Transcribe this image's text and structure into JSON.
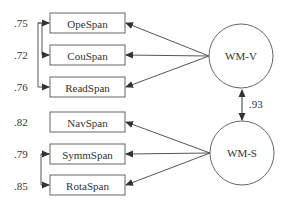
{
  "diagram": {
    "type": "structural-equation-model",
    "observed": [
      {
        "id": "OpeSpan",
        "label": "OpeSpan",
        "loading": ".75",
        "factor": "WM-V"
      },
      {
        "id": "CouSpan",
        "label": "CouSpan",
        "loading": ".72",
        "factor": "WM-V"
      },
      {
        "id": "ReadSpan",
        "label": "ReadSpan",
        "loading": ".76",
        "factor": "WM-V"
      },
      {
        "id": "NavSpan",
        "label": "NavSpan",
        "loading": ".82",
        "factor": "WM-S"
      },
      {
        "id": "SymmSpan",
        "label": "SymmSpan",
        "loading": ".79",
        "factor": "WM-S"
      },
      {
        "id": "RotaSpan",
        "label": "RotaSpan",
        "loading": ".85",
        "factor": "WM-S"
      }
    ],
    "latent": [
      {
        "id": "WM-V",
        "label": "WM-V"
      },
      {
        "id": "WM-S",
        "label": "WM-S"
      }
    ],
    "correlation": {
      "from": "WM-V",
      "to": "WM-S",
      "value": ".93"
    },
    "error_covariances": [
      {
        "from": "OpeSpan",
        "to": "CouSpan"
      },
      {
        "from": "OpeSpan",
        "to": "ReadSpan"
      },
      {
        "from": "SymmSpan",
        "to": "RotaSpan"
      }
    ],
    "colors": {
      "stroke": "#555555",
      "text": "#333333",
      "background": "#ffffff"
    }
  }
}
